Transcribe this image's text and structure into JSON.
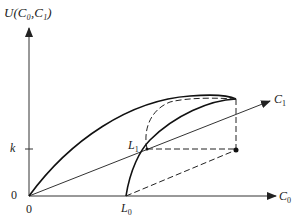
{
  "diagram": {
    "y_axis_label": "U(C₀,C₁)",
    "x_axis_label_main": "C",
    "x_axis_label_sub": "0",
    "diag_axis_label_main": "C",
    "diag_axis_label_sub": "1",
    "k_label": "k",
    "y_origin_label": "0",
    "x_origin_label": "0",
    "L0_main": "L",
    "L0_sub": "0",
    "L1_main": "L",
    "L1_sub": "1"
  }
}
